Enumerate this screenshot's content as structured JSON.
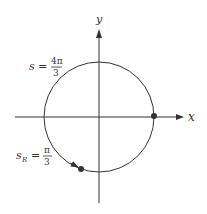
{
  "diagram": {
    "axes": {
      "x_label": "x",
      "y_label": "y"
    },
    "labels": {
      "s_top": {
        "lhs": "s",
        "eq": "=",
        "num": "4π",
        "den": "3"
      },
      "s_bottom": {
        "lhs": "s",
        "sub": "R",
        "eq": "=",
        "num": "π",
        "den": "3"
      }
    },
    "points": [
      {
        "name": "start-point",
        "position": "positive x-axis"
      },
      {
        "name": "end-point",
        "position": "lower-left of circle"
      }
    ],
    "colors": {
      "stroke": "#333333",
      "point": "#333333",
      "background": "#ffffff"
    }
  }
}
